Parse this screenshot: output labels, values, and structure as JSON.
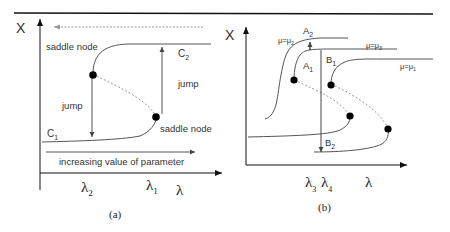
{
  "panel_a": {
    "caption": "(a)",
    "y_axis_label": "X",
    "x_axis_label": "λ",
    "curve_upper_label": "C",
    "curve_upper_sub": "2",
    "curve_lower_label": "C",
    "curve_lower_sub": "1",
    "saddle_top": "saddle node",
    "saddle_bottom": "saddle node",
    "jump_left": "jump",
    "jump_right": "jump",
    "param_arrow_label": "increasing value of parameter",
    "tick_lambda2": "λ",
    "tick_lambda2_sub": "2",
    "tick_lambda1": "λ",
    "tick_lambda1_sub": "1"
  },
  "panel_b": {
    "caption": "(b)",
    "y_axis_label": "X",
    "x_axis_label": "λ",
    "mu2_label": "μ=μ",
    "mu2_sub": "2",
    "mu3_label": "μ=μ",
    "mu3_sub": "3",
    "mu1_label": "μ=μ",
    "mu1_sub": "1",
    "point_A2": "A",
    "point_A2_sub": "2",
    "point_A1": "A",
    "point_A1_sub": "1",
    "point_B1": "B",
    "point_B1_sub": "1",
    "point_B2": "B",
    "point_B2_sub": "2",
    "tick_lambda3": "λ",
    "tick_lambda3_sub": "3",
    "tick_lambda4": "λ",
    "tick_lambda4_sub": "4"
  },
  "colors": {
    "line": "#444444",
    "axis": "#111111",
    "dotted": "#999999",
    "dot": "#000000"
  }
}
